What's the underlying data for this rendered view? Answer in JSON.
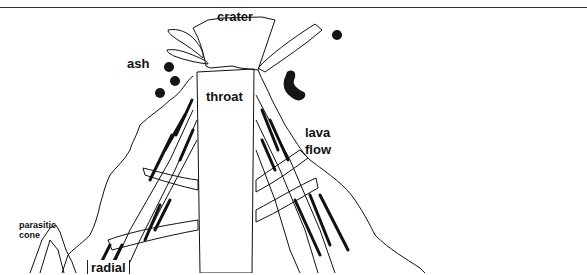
{
  "figure": {
    "labels": {
      "crater": "crater",
      "ash": "ash",
      "throat": "throat",
      "lava_flow_line1": "lava",
      "lava_flow_line2": "flow",
      "parasitic_cone_line1": "parasitic",
      "parasitic_cone_line2": "cone",
      "radial": "radial"
    },
    "colors": {
      "ink": "#111111",
      "background": "#ffffff"
    }
  }
}
